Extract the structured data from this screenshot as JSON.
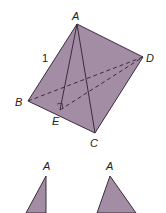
{
  "diagram": {
    "type": "tetrahedron",
    "fill_color": "#a38da5",
    "edge_color": "#3a2c3a",
    "vertices": {
      "A": {
        "label": "A",
        "x": 77,
        "y": 24
      },
      "B": {
        "label": "B",
        "x": 28,
        "y": 101
      },
      "C": {
        "label": "C",
        "x": 95,
        "y": 133
      },
      "D": {
        "label": "D",
        "x": 143,
        "y": 57
      },
      "E": {
        "label": "E",
        "x": 60,
        "y": 110
      }
    },
    "edge_label": "1",
    "right_angle_at": "E",
    "hidden_edges": [
      "BD",
      "ED"
    ]
  },
  "sub_figures": [
    {
      "label": "A"
    },
    {
      "label": "A"
    }
  ]
}
